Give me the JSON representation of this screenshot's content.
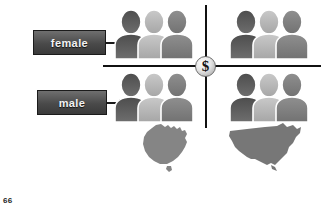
{
  "slide": {
    "page_number": "66",
    "background_color": "#ffffff",
    "line_color": "#111111"
  },
  "labels": [
    {
      "key": "female",
      "text": "female",
      "box_color": "#4a4a4a",
      "text_color": "#f2f2f2",
      "points_to": "top-row-people-groups"
    },
    {
      "key": "male",
      "text": "male",
      "box_color": "#4a4a4a",
      "text_color": "#f2f2f2",
      "points_to": "bottom-row-people-groups"
    }
  ],
  "center_icon": {
    "name": "dollar-coin-icon",
    "symbol": "$",
    "description": "coin at intersection of the quadrant axes"
  },
  "quadrants": [
    {
      "position": "top-left",
      "row_label": "female",
      "column_country": "Australia",
      "icon_name": "three-people-icon",
      "person_count": 3,
      "person_shades": [
        "#5a5a5a",
        "#b4b4b4",
        "#8c8c8c"
      ]
    },
    {
      "position": "top-right",
      "row_label": "female",
      "column_country": "United States",
      "icon_name": "three-people-icon",
      "person_count": 3,
      "person_shades": [
        "#5a5a5a",
        "#b4b4b4",
        "#8c8c8c"
      ]
    },
    {
      "position": "bottom-left",
      "row_label": "male",
      "column_country": "Australia",
      "icon_name": "three-people-icon",
      "person_count": 3,
      "person_shades": [
        "#5a5a5a",
        "#b4b4b4",
        "#8c8c8c"
      ]
    },
    {
      "position": "bottom-right",
      "row_label": "male",
      "column_country": "United States",
      "icon_name": "three-people-icon",
      "person_count": 3,
      "person_shades": [
        "#5a5a5a",
        "#b4b4b4",
        "#8c8c8c"
      ]
    }
  ],
  "maps": [
    {
      "key": "australia",
      "icon_name": "australia-map-icon",
      "country": "Australia",
      "column": "left",
      "fill_color": "#858585"
    },
    {
      "key": "usa",
      "icon_name": "usa-map-icon",
      "country": "United States",
      "column": "right",
      "fill_color": "#777777"
    }
  ]
}
